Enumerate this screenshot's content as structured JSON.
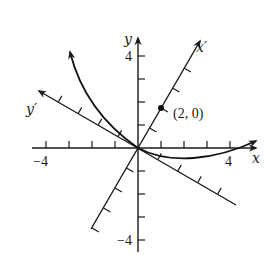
{
  "diagram": {
    "type": "rotated-axes-conic",
    "axes": {
      "x": {
        "label": "x",
        "tick_label_pos": "4",
        "tick_label_neg": "−4"
      },
      "y": {
        "label": "y",
        "tick_label_pos": "4",
        "tick_label_neg": "−4"
      },
      "x_prime": {
        "label": "x′",
        "rotation_deg": 60
      },
      "y_prime": {
        "label": "y′",
        "rotation_deg": 150
      }
    },
    "point": {
      "label": "(2, 0)",
      "x_prime": 2,
      "y_prime": 0
    },
    "curve": {
      "name": "parabola",
      "vertex": "origin"
    },
    "colors": {
      "ink": "#1a1a1a",
      "background": "#ffffff"
    }
  }
}
